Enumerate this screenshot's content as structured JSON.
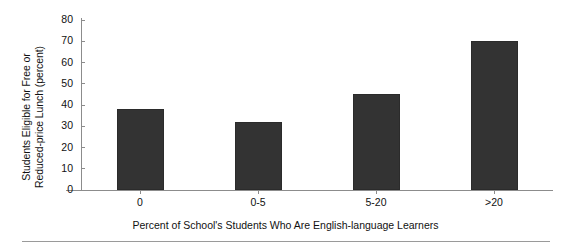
{
  "chart_data": {
    "type": "bar",
    "title": "",
    "xlabel": "Percent of School's Students Who Are English-language Learners",
    "ylabel": "Students Eligible for Free or Reduced-price Lunch (percent)",
    "ylabel_line1": "Students Eligible for Free or",
    "ylabel_line2": "Reduced-price Lunch (percent)",
    "categories": [
      "0",
      "0-5",
      "5-20",
      ">20"
    ],
    "values": [
      38,
      32,
      45,
      70
    ],
    "ylim": [
      0,
      80
    ],
    "yticks": [
      0,
      10,
      20,
      30,
      40,
      50,
      60,
      70,
      80
    ],
    "ytick_labels": [
      "0",
      "10",
      "20",
      "30",
      "40",
      "50",
      "60",
      "70",
      "80"
    ],
    "grid": false,
    "legend": false,
    "bar_color": "#333333",
    "axis_color": "#8c8c8c"
  }
}
